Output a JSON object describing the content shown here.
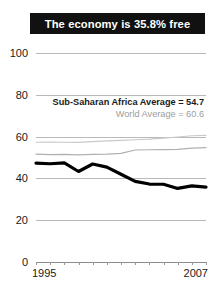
{
  "title": {
    "text": "The economy is 35.8% free",
    "background": "#111111",
    "color": "#ffffff"
  },
  "annotations": {
    "africa_average": "Sub-Saharan Africa Average = 54.7",
    "world_average": "World Average = 60.6"
  },
  "axis": {
    "y_ticks": [
      "0",
      "20",
      "40",
      "60",
      "80",
      "100"
    ],
    "x_start_label": "1995",
    "x_end_label": "2007"
  },
  "chart_data": {
    "type": "line",
    "title": "The economy is 35.8% free",
    "xlabel": "",
    "ylabel": "",
    "xlim": [
      1995,
      2007
    ],
    "ylim": [
      0,
      100
    ],
    "yticks": [
      0,
      20,
      40,
      60,
      80,
      100
    ],
    "xticks": [
      1995,
      1996,
      1997,
      1998,
      1999,
      2000,
      2001,
      2002,
      2003,
      2004,
      2005,
      2006,
      2007
    ],
    "xtick_labels_shown": [
      "1995",
      "2007"
    ],
    "grid": true,
    "legend": "inline-annotations",
    "x": [
      1995,
      1996,
      1997,
      1998,
      1999,
      2000,
      2001,
      2002,
      2003,
      2004,
      2005,
      2006,
      2007
    ],
    "series": [
      {
        "name": "Economic freedom score",
        "color": "#000000",
        "width": 3.2,
        "values": [
          47.3,
          47.0,
          47.4,
          43.3,
          46.9,
          45.4,
          42.0,
          38.6,
          37.3,
          37.2,
          35.2,
          36.4,
          35.8
        ]
      },
      {
        "name": "Sub-Saharan Africa Average",
        "color": "#b0b0b0",
        "width": 1.2,
        "values": [
          51.6,
          51.4,
          51.5,
          51.3,
          51.5,
          51.6,
          52.0,
          53.6,
          53.7,
          53.8,
          53.9,
          54.5,
          54.7
        ]
      },
      {
        "name": "World Average",
        "color": "#c9c9c9",
        "width": 1.2,
        "values": [
          57.3,
          57.4,
          57.3,
          57.2,
          57.6,
          58.0,
          58.2,
          58.5,
          58.8,
          59.3,
          59.8,
          60.4,
          60.6
        ]
      }
    ]
  }
}
